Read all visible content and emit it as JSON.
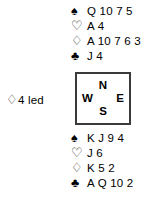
{
  "diagram": {
    "type": "bridge-deal",
    "suit_glyphs": {
      "spades": "♠",
      "hearts": "♡",
      "diamonds": "♢",
      "clubs": "♣"
    },
    "colors": {
      "ink": "#000000",
      "outline_ink": "#2b2b2b",
      "box_border": "#3a3a3a",
      "background": "#ffffff"
    }
  },
  "north": {
    "label": "North",
    "suits": [
      {
        "name": "spades",
        "symbol": "♠",
        "fill": "solid",
        "cards": "Q 10 7 5"
      },
      {
        "name": "hearts",
        "symbol": "♡",
        "fill": "outline",
        "cards": "A 4"
      },
      {
        "name": "diamonds",
        "symbol": "♢",
        "fill": "outline",
        "cards": "A 10 7 6 3"
      },
      {
        "name": "clubs",
        "symbol": "♣",
        "fill": "solid",
        "cards": "J 4"
      }
    ]
  },
  "south": {
    "label": "South",
    "suits": [
      {
        "name": "spades",
        "symbol": "♠",
        "fill": "solid",
        "cards": "K J 9 4"
      },
      {
        "name": "hearts",
        "symbol": "♡",
        "fill": "outline",
        "cards": "J 6"
      },
      {
        "name": "diamonds",
        "symbol": "♢",
        "fill": "outline",
        "cards": "K 5 2"
      },
      {
        "name": "clubs",
        "symbol": "♣",
        "fill": "solid",
        "cards": "A Q 10 2"
      }
    ]
  },
  "compass": {
    "north": "N",
    "west": "W",
    "east": "E",
    "south": "S"
  },
  "lead": {
    "suit_symbol": "♢",
    "text": "4 led"
  }
}
